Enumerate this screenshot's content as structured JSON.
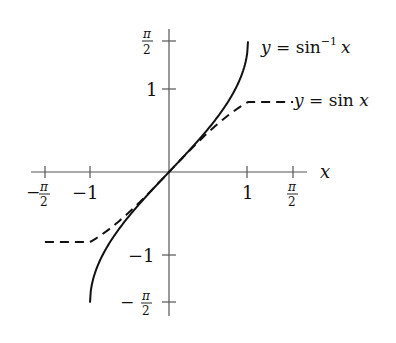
{
  "chart_data": {
    "type": "line",
    "title": "",
    "xlabel": "x",
    "ylabel": "",
    "xlim": [
      -1.65,
      1.75
    ],
    "ylim": [
      -1.75,
      1.72
    ],
    "grid": false,
    "x_ticks": [
      {
        "value": -1.5708,
        "label_main": "π",
        "label_den": "2",
        "sign": "−"
      },
      {
        "value": -1,
        "label": "−1"
      },
      {
        "value": 1,
        "label": "1"
      },
      {
        "value": 1.5708,
        "label_main": "π",
        "label_den": "2",
        "sign": ""
      }
    ],
    "y_ticks": [
      {
        "value": 1.5708,
        "label_main": "π",
        "label_den": "2",
        "sign": ""
      },
      {
        "value": 1,
        "label": "1"
      },
      {
        "value": -1,
        "label": "−1"
      },
      {
        "value": -1.5708,
        "label_main": "π",
        "label_den": "2",
        "sign": "−"
      }
    ],
    "series": [
      {
        "name": "y = sin⁻¹ x",
        "style": "solid",
        "domain": [
          -1,
          1
        ],
        "x": [
          -1,
          -0.98,
          -0.9,
          -0.75,
          -0.5,
          -0.25,
          0,
          0.25,
          0.5,
          0.75,
          0.9,
          0.98,
          1
        ],
        "y": [
          -1.5708,
          -1.3705,
          -1.1198,
          -0.8481,
          -0.5236,
          -0.2527,
          0,
          0.2527,
          0.5236,
          0.8481,
          1.1198,
          1.3705,
          1.5708
        ]
      },
      {
        "name": "y = sin x",
        "style": "dashed",
        "domain": [
          -1.5708,
          1.5708
        ],
        "x": [
          -1.5708,
          -1.2,
          -0.8,
          -0.4,
          0,
          0.4,
          0.8,
          1.2,
          1.5708
        ],
        "y": [
          -1,
          -0.932,
          -0.717,
          -0.389,
          0,
          0.389,
          0.717,
          0.932,
          1
        ]
      }
    ],
    "annotations": [
      {
        "text_prefix": "y",
        "text_eq": " = sin",
        "text_sup": "−1",
        "text_var": "x",
        "near": "end of arcsin curve"
      },
      {
        "text_prefix": "y",
        "text_eq": " = sin ",
        "text_var": "x",
        "near": "end of sin curve"
      }
    ],
    "colors": {
      "axis": "#555555",
      "curve": "#111111"
    }
  }
}
